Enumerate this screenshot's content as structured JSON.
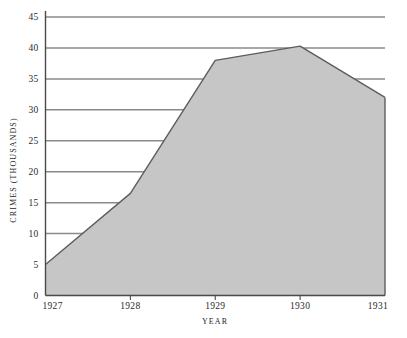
{
  "chart_data": {
    "type": "area",
    "title": "",
    "subtitle": "",
    "xlabel": "YEAR",
    "ylabel": "CRIMES (THOUSANDS)",
    "x": [
      1927,
      1928,
      1929,
      1930,
      1931
    ],
    "categories": [
      "1927",
      "1928",
      "1929",
      "1930",
      "1931"
    ],
    "values": [
      5,
      16.5,
      38,
      40.3,
      32
    ],
    "series": [
      {
        "name": "Crimes",
        "values": [
          5,
          16.5,
          38,
          40.3,
          32
        ]
      }
    ],
    "xlim": [
      1927,
      1931
    ],
    "ylim": [
      0,
      45
    ],
    "ytick_labels": [
      "0",
      "5",
      "10",
      "15",
      "20",
      "25",
      "30",
      "35",
      "40",
      "45"
    ],
    "ytick_values": [
      0,
      5,
      10,
      15,
      20,
      25,
      30,
      35,
      40,
      45
    ],
    "xtick_labels": [
      "1927",
      "1928",
      "1929",
      "1930",
      "1931"
    ],
    "grid": "horizontal",
    "legend": "none",
    "annotations": [],
    "colors": {
      "area_fill": "#c6c6c6",
      "area_stroke": "#5d5d5d",
      "gridline": "#8a8a8a",
      "axis": "#4a4a4a",
      "text": "#2b2b2b",
      "background": "#ffffff"
    }
  },
  "axes": {
    "y_title": "CRIMES (THOUSANDS)",
    "x_title": "YEAR"
  },
  "y_ticks": [
    {
      "label": "45",
      "value": 45
    },
    {
      "label": "40",
      "value": 40
    },
    {
      "label": "35",
      "value": 35
    },
    {
      "label": "30",
      "value": 30
    },
    {
      "label": "25",
      "value": 25
    },
    {
      "label": "20",
      "value": 20
    },
    {
      "label": "15",
      "value": 15
    },
    {
      "label": "10",
      "value": 10
    },
    {
      "label": "5",
      "value": 5
    },
    {
      "label": "0",
      "value": 0
    }
  ],
  "x_ticks": [
    {
      "label": "1927",
      "value": 1927
    },
    {
      "label": "1928",
      "value": 1928
    },
    {
      "label": "1929",
      "value": 1929
    },
    {
      "label": "1930",
      "value": 1930
    },
    {
      "label": "1931",
      "value": 1931
    }
  ]
}
